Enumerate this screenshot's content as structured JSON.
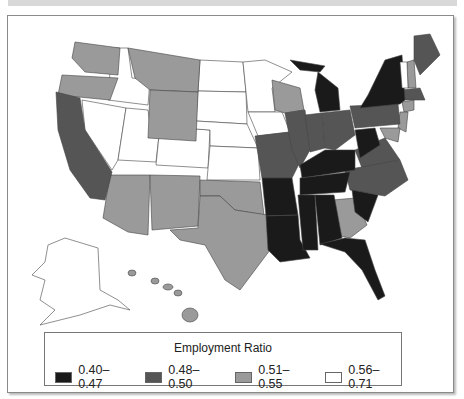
{
  "legend": {
    "title": "Employment Ratio",
    "items": [
      {
        "label": "0.40–0.47",
        "color": "#1a1a1a"
      },
      {
        "label": "0.48–0.50",
        "color": "#555555"
      },
      {
        "label": "0.51–0.55",
        "color": "#9a9a9a"
      },
      {
        "label": "0.56–0.71",
        "color": "#ffffff"
      }
    ]
  },
  "map": {
    "title": "US states by Employment Ratio",
    "classes": {
      "0.40-0.47": [
        "Michigan",
        "New York",
        "Kentucky",
        "West Virginia",
        "Tennessee",
        "Arkansas",
        "Louisiana",
        "Mississippi",
        "Alabama",
        "South Carolina",
        "Florida"
      ],
      "0.48-0.50": [
        "California",
        "Missouri",
        "Illinois",
        "Indiana",
        "Ohio",
        "Pennsylvania",
        "Virginia",
        "North Carolina",
        "Maine",
        "Massachusetts"
      ],
      "0.51-0.55": [
        "Washington",
        "Oregon",
        "Montana",
        "Wyoming",
        "Arizona",
        "New Mexico",
        "Texas",
        "Oklahoma",
        "Wisconsin",
        "Georgia",
        "New Hampshire",
        "New Jersey",
        "Maryland",
        "Connecticut",
        "Hawaii"
      ],
      "0.56-0.71": [
        "Idaho",
        "Nevada",
        "Utah",
        "Colorado",
        "North Dakota",
        "South Dakota",
        "Nebraska",
        "Kansas",
        "Minnesota",
        "Iowa",
        "Vermont",
        "Alaska"
      ]
    }
  }
}
